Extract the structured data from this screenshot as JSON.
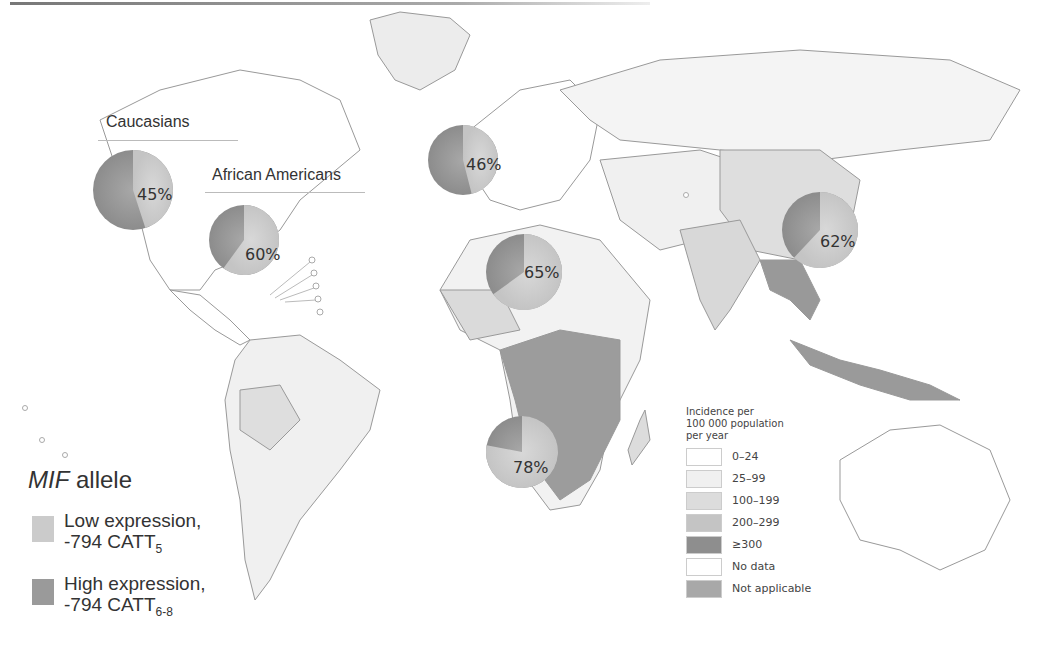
{
  "map": {
    "populations": [
      {
        "label": "Caucasians",
        "low_pct": 45,
        "pct_text": "45%"
      },
      {
        "label": "African Americans",
        "low_pct": 60,
        "pct_text": "60%"
      },
      {
        "label": "Europe",
        "low_pct": 46,
        "pct_text": "46%"
      },
      {
        "label": "West Africa",
        "low_pct": 65,
        "pct_text": "65%"
      },
      {
        "label": "Southern Africa",
        "low_pct": 78,
        "pct_text": "78%"
      },
      {
        "label": "East Asia",
        "low_pct": 62,
        "pct_text": "62%"
      }
    ],
    "labels": {
      "caucasians": "Caucasians",
      "african_americans": "African Americans"
    }
  },
  "mif_legend": {
    "title_italic": "MIF",
    "title_rest": " allele",
    "items": [
      {
        "line1": "Low expression,",
        "line2": "-794 CATT",
        "sub": "5",
        "color": "#c8c8c8"
      },
      {
        "line1": "High expression,",
        "line2": "-794 CATT",
        "sub": "6-8",
        "color": "#999999"
      }
    ]
  },
  "incidence_legend": {
    "title_lines": [
      "Incidence per",
      "100 000 population",
      "per year"
    ],
    "items": [
      {
        "label": "0–24",
        "color": "#ffffff"
      },
      {
        "label": "25–99",
        "color": "#f0f0f0"
      },
      {
        "label": "100–199",
        "color": "#dcdcdc"
      },
      {
        "label": "200–299",
        "color": "#c4c4c4"
      },
      {
        "label": "≥300",
        "color": "#8e8e8e"
      },
      {
        "label": "No data",
        "color": "#ffffff"
      },
      {
        "label": "Not applicable",
        "color": "#a8a8a8"
      }
    ]
  },
  "colors": {
    "low_expression": "#cfcfcf",
    "high_expression": "#9a9a9a",
    "border": "#8a8a8a"
  }
}
